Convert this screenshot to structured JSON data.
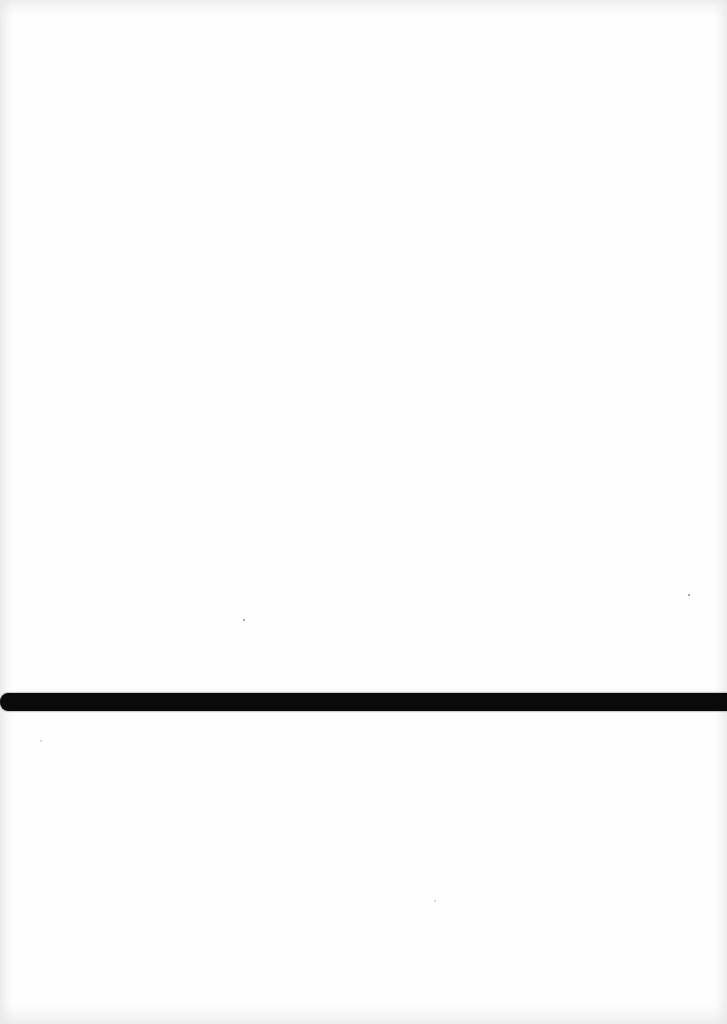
{
  "page": {
    "content": "",
    "colors": {
      "paper": "#fefefe",
      "band": "#0a0a0a"
    }
  }
}
